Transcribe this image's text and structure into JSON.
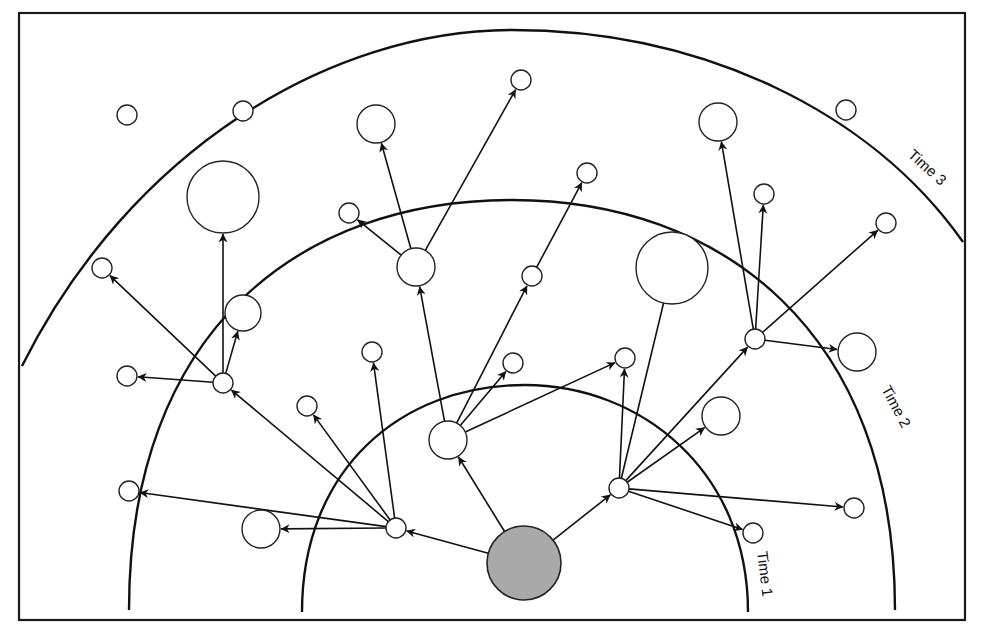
{
  "figure": {
    "title": ""
  },
  "colors": {
    "line": "#111111",
    "node_fill": "#ffffff",
    "origin_fill": "#a9a9a9"
  },
  "horizons": [
    {
      "id": "t1",
      "label": "Time 1"
    },
    {
      "id": "t2",
      "label": "Time 2"
    },
    {
      "id": "t3",
      "label": "Time 3"
    }
  ],
  "nodes": [
    {
      "id": "origin",
      "kind": "origin",
      "size": "large"
    },
    {
      "id": "a",
      "kind": "hub",
      "size": "small"
    },
    {
      "id": "b",
      "kind": "hub",
      "size": "medium"
    },
    {
      "id": "c",
      "kind": "hub",
      "size": "small"
    },
    {
      "id": "d",
      "kind": "hub",
      "size": "small"
    },
    {
      "id": "e",
      "kind": "hub",
      "size": "medium"
    },
    {
      "id": "f",
      "kind": "hub",
      "size": "small"
    },
    {
      "id": "g",
      "kind": "hub",
      "size": "small"
    },
    {
      "id": "a1",
      "kind": "leaf",
      "size": "medium"
    },
    {
      "id": "a2",
      "kind": "leaf",
      "size": "small"
    },
    {
      "id": "a3",
      "kind": "leaf",
      "size": "small"
    },
    {
      "id": "b1",
      "kind": "leaf",
      "size": "small"
    },
    {
      "id": "b2",
      "kind": "leaf",
      "size": "small"
    },
    {
      "id": "c1",
      "kind": "leaf",
      "size": "small"
    },
    {
      "id": "c2",
      "kind": "leaf",
      "size": "xlarge"
    },
    {
      "id": "c3",
      "kind": "leaf",
      "size": "medium"
    },
    {
      "id": "c4",
      "kind": "leaf",
      "size": "small"
    },
    {
      "id": "d1",
      "kind": "leaf",
      "size": "small"
    },
    {
      "id": "d2",
      "kind": "leaf",
      "size": "xlarge"
    },
    {
      "id": "d3",
      "kind": "leaf",
      "size": "small"
    },
    {
      "id": "e1",
      "kind": "leaf",
      "size": "small"
    },
    {
      "id": "e2",
      "kind": "leaf",
      "size": "medium"
    },
    {
      "id": "e3",
      "kind": "leaf",
      "size": "small"
    },
    {
      "id": "f1",
      "kind": "leaf",
      "size": "small"
    },
    {
      "id": "f2",
      "kind": "leaf",
      "size": "small"
    },
    {
      "id": "f3",
      "kind": "leaf",
      "size": "medium"
    },
    {
      "id": "f4",
      "kind": "leaf",
      "size": "small"
    },
    {
      "id": "f5",
      "kind": "leaf",
      "size": "small"
    },
    {
      "id": "g1",
      "kind": "leaf",
      "size": "medium"
    },
    {
      "id": "g2",
      "kind": "leaf",
      "size": "small"
    },
    {
      "id": "g3",
      "kind": "leaf",
      "size": "small"
    },
    {
      "id": "g4",
      "kind": "leaf",
      "size": "medium"
    },
    {
      "id": "x1",
      "kind": "isolated",
      "size": "small"
    },
    {
      "id": "x2",
      "kind": "isolated",
      "size": "small"
    },
    {
      "id": "x3",
      "kind": "isolated",
      "size": "small"
    },
    {
      "id": "x4",
      "kind": "isolated",
      "size": "xlarge"
    }
  ],
  "edges": [
    [
      "origin",
      "a"
    ],
    [
      "origin",
      "b"
    ],
    [
      "origin",
      "f"
    ],
    [
      "a",
      "a1"
    ],
    [
      "a",
      "a2"
    ],
    [
      "a",
      "a3"
    ],
    [
      "a",
      "c"
    ],
    [
      "a",
      "b1"
    ],
    [
      "b",
      "e"
    ],
    [
      "b",
      "b2"
    ],
    [
      "b",
      "d"
    ],
    [
      "b",
      "d1"
    ],
    [
      "c",
      "c1"
    ],
    [
      "c",
      "c2"
    ],
    [
      "c",
      "c3"
    ],
    [
      "c",
      "c4"
    ],
    [
      "d",
      "d3"
    ],
    [
      "e",
      "e1"
    ],
    [
      "e",
      "e2"
    ],
    [
      "e",
      "e3"
    ],
    [
      "f",
      "f1"
    ],
    [
      "f",
      "f2"
    ],
    [
      "f",
      "f3"
    ],
    [
      "f",
      "f4"
    ],
    [
      "f",
      "f5"
    ],
    [
      "f",
      "g"
    ],
    [
      "f",
      "x4"
    ],
    [
      "g",
      "g1"
    ],
    [
      "g",
      "g2"
    ],
    [
      "g",
      "g3"
    ],
    [
      "g",
      "g4"
    ]
  ]
}
